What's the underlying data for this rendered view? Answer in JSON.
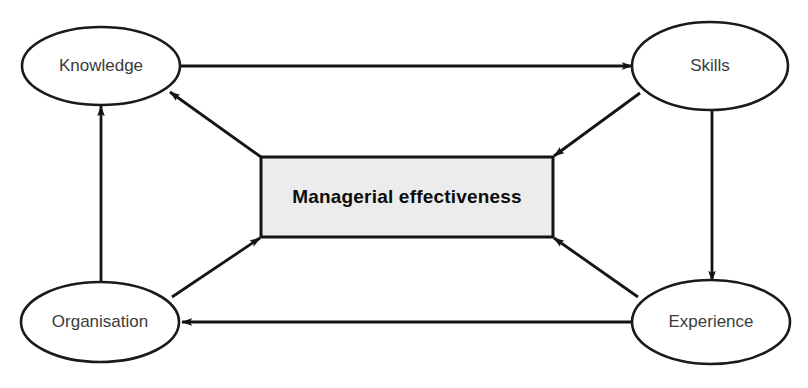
{
  "diagram": {
    "type": "influence-diagram",
    "canvas": {
      "width": 808,
      "height": 388,
      "background": "#ffffff"
    },
    "colors": {
      "node_fill": "#ffffff",
      "node_stroke": "#1a1a1a",
      "node_text": "#3b3b3b",
      "box_fill": "#ececec",
      "box_stroke": "#141414",
      "box_text": "#0d0d0d",
      "edge": "#141414"
    },
    "center_box": {
      "label": "Managerial effectiveness",
      "x": 261,
      "y": 157,
      "width": 292,
      "height": 80
    },
    "nodes": [
      {
        "id": "knowledge",
        "label": "Knowledge",
        "cx": 101,
        "cy": 66,
        "rx": 79,
        "ry": 39
      },
      {
        "id": "skills",
        "label": "Skills",
        "cx": 710,
        "cy": 66,
        "rx": 78,
        "ry": 44
      },
      {
        "id": "organisation",
        "label": "Organisation",
        "cx": 100,
        "cy": 322,
        "rx": 79,
        "ry": 40
      },
      {
        "id": "experience",
        "label": "Experience",
        "cx": 711,
        "cy": 322,
        "rx": 79,
        "ry": 42
      }
    ],
    "edges": [
      {
        "id": "knowledge-to-skills",
        "from": "knowledge",
        "to": "skills",
        "arrow": "end",
        "shape": "horizontal-top"
      },
      {
        "id": "experience-to-organisation",
        "from": "experience",
        "to": "organisation",
        "arrow": "end",
        "shape": "horizontal-bottom"
      },
      {
        "id": "organisation-to-knowledge",
        "from": "organisation",
        "to": "knowledge",
        "arrow": "end",
        "shape": "vertical-left"
      },
      {
        "id": "skills-to-experience",
        "from": "skills",
        "to": "experience",
        "arrow": "end",
        "shape": "vertical-right"
      },
      {
        "id": "box-to-knowledge",
        "from": "center_box",
        "to": "knowledge",
        "arrow": "end",
        "shape": "diagonal-upper-left"
      },
      {
        "id": "skills-to-box",
        "from": "skills",
        "to": "center_box",
        "arrow": "end",
        "shape": "diagonal-upper-right"
      },
      {
        "id": "organisation-to-box",
        "from": "organisation",
        "to": "center_box",
        "arrow": "end",
        "shape": "diagonal-lower-left"
      },
      {
        "id": "experience-to-box",
        "from": "experience",
        "to": "center_box",
        "arrow": "end",
        "shape": "diagonal-lower-right"
      }
    ]
  }
}
